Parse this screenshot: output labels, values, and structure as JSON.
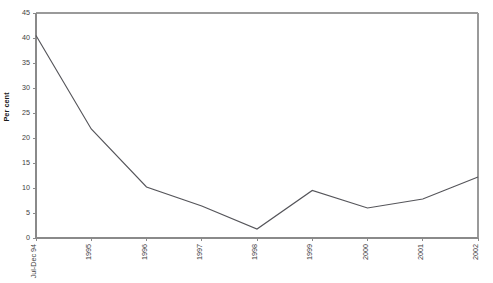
{
  "chart_data": {
    "type": "line",
    "title": "",
    "subtitle": "",
    "xlabel": "",
    "ylabel": "Per cent",
    "categories": [
      "Jul-Dec 94",
      "1995",
      "1996",
      "1997",
      "1998",
      "1999",
      "2000",
      "2001",
      "2002"
    ],
    "values": [
      40.5,
      21.8,
      10.2,
      6.4,
      1.8,
      9.5,
      6.0,
      7.8,
      12.2
    ],
    "series": [
      {
        "name": "Per cent",
        "values": [
          40.5,
          21.8,
          10.2,
          6.4,
          1.8,
          9.5,
          6.0,
          7.8,
          12.2
        ]
      }
    ],
    "ylim": [
      0,
      45
    ],
    "ytick_step": 5,
    "ytick_labels": [
      "0",
      "5",
      "10",
      "15",
      "20",
      "25",
      "30",
      "35",
      "40",
      "45"
    ],
    "ytick_values": [
      0,
      5,
      10,
      15,
      20,
      25,
      30,
      35,
      40,
      45
    ],
    "grid": false,
    "legend": false,
    "legend_position": "none",
    "xtick_rotation": 90,
    "line_color": "#55555a",
    "axis_color": "#8a8a8a",
    "frame_color": "#9a9a9a",
    "background_color": "#ffffff"
  }
}
